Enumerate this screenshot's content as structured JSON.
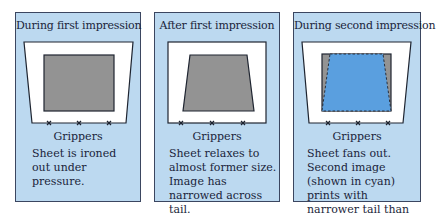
{
  "colors": {
    "panel_bg": "#bcd9f0",
    "sheet": "#ffffff",
    "image_first": "#939393",
    "image_second_cyan": "#5a9fdf",
    "outline": "#1e2430"
  },
  "panels": [
    {
      "title": "During first impression",
      "gripper_label": "Grippers",
      "caption": "Sheet is ironed out under pressure."
    },
    {
      "title": "After first impression",
      "gripper_label": "Grippers",
      "caption": "Sheet relaxes to almost former size. Image has narrowed across tail."
    },
    {
      "title": "During second impression",
      "gripper_label": "Grippers",
      "caption": "Sheet fans out. Second image (shown in cyan) prints with narrower tail than first image."
    }
  ]
}
